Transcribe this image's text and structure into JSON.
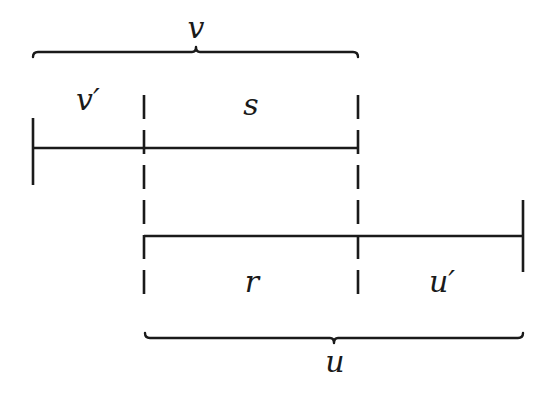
{
  "diagram": {
    "type": "interval-overlap",
    "labels": {
      "top_brace": "v",
      "v_prime": "v′",
      "s": "s",
      "r": "r",
      "u_prime": "u′",
      "bottom_brace": "u"
    },
    "colors": {
      "ink": "#1a1a1a",
      "background": "#ffffff"
    }
  }
}
